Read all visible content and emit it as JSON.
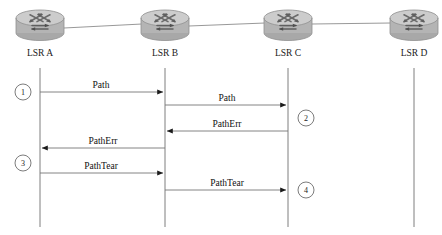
{
  "diagram": {
    "type": "sequence-diagram",
    "colors": {
      "background": "#ffffff",
      "lifeline": "#6f6f6f",
      "link": "#8c8c8c",
      "arrow": "#767676",
      "arrowhead": "#1b1b1b",
      "text": "#111111",
      "router_body": "#b6b6b6",
      "router_top": "#cfcfcf",
      "router_glyph": "#6a6a6a"
    },
    "nodes": [
      {
        "id": "a",
        "label": "LSR A",
        "icon": "router-icon",
        "x": 40,
        "icon_cx": 40,
        "icon_cy": 24
      },
      {
        "id": "b",
        "label": "LSR B",
        "icon": "router-icon",
        "x": 165,
        "icon_cx": 165,
        "icon_cy": 24
      },
      {
        "id": "c",
        "label": "LSR C",
        "icon": "router-icon",
        "x": 288,
        "icon_cx": 288,
        "icon_cy": 24
      },
      {
        "id": "d",
        "label": "LSR D",
        "icon": "router-icon",
        "x": 414,
        "icon_cx": 414,
        "icon_cy": 24
      }
    ],
    "links": [
      {
        "from": "LSR A",
        "to": "LSR B"
      },
      {
        "from": "LSR B",
        "to": "LSR C"
      },
      {
        "from": "LSR C",
        "to": "LSR D"
      }
    ],
    "messages": [
      {
        "step": "1",
        "label": "Path",
        "from": "LSR A",
        "to": "LSR B",
        "direction": "right",
        "y": 92
      },
      {
        "step": "2",
        "label": "Path",
        "from": "LSR B",
        "to": "LSR C",
        "direction": "right",
        "y": 105
      },
      {
        "step": "",
        "label": "PathErr",
        "from": "LSR C",
        "to": "LSR B",
        "direction": "left",
        "y": 131
      },
      {
        "step": "3",
        "label": "PathErr",
        "from": "LSR B",
        "to": "LSR A",
        "direction": "left",
        "y": 148
      },
      {
        "step": "",
        "label": "PathTear",
        "from": "LSR A",
        "to": "LSR B",
        "direction": "right",
        "y": 173
      },
      {
        "step": "4",
        "label": "PathTear",
        "from": "LSR B",
        "to": "LSR C",
        "direction": "right",
        "y": 190
      }
    ],
    "step_markers": [
      {
        "number": "1",
        "cx": 23,
        "cy": 92,
        "side": "left-of-lsr-a"
      },
      {
        "number": "2",
        "cx": 306,
        "cy": 118,
        "side": "right-of-lsr-c"
      },
      {
        "number": "3",
        "cx": 23,
        "cy": 163,
        "side": "left-of-lsr-a"
      },
      {
        "number": "4",
        "cx": 306,
        "cy": 190,
        "side": "right-of-lsr-c"
      }
    ],
    "labels": {
      "path": "Path",
      "path_err": "PathErr",
      "path_tear": "PathTear"
    }
  }
}
